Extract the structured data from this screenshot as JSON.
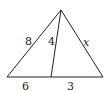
{
  "diagram": {
    "type": "triangle-with-cevian",
    "points": {
      "apex": [
        61,
        10
      ],
      "base_left": [
        7,
        77
      ],
      "base_right": [
        103,
        77
      ],
      "cevian_foot": [
        51,
        77
      ]
    },
    "labels": {
      "left_side": "8",
      "cevian": "4",
      "right_side": "x",
      "base_left_segment": "6",
      "base_right_segment": "3"
    },
    "label_positions": {
      "left_side": [
        25,
        45
      ],
      "cevian": [
        48,
        45
      ],
      "right_side": [
        83,
        46
      ],
      "base_left_segment": [
        22,
        90
      ],
      "base_right_segment": [
        67,
        90
      ]
    },
    "colors": {
      "stroke": "#222222",
      "background": "#ffffff"
    }
  }
}
